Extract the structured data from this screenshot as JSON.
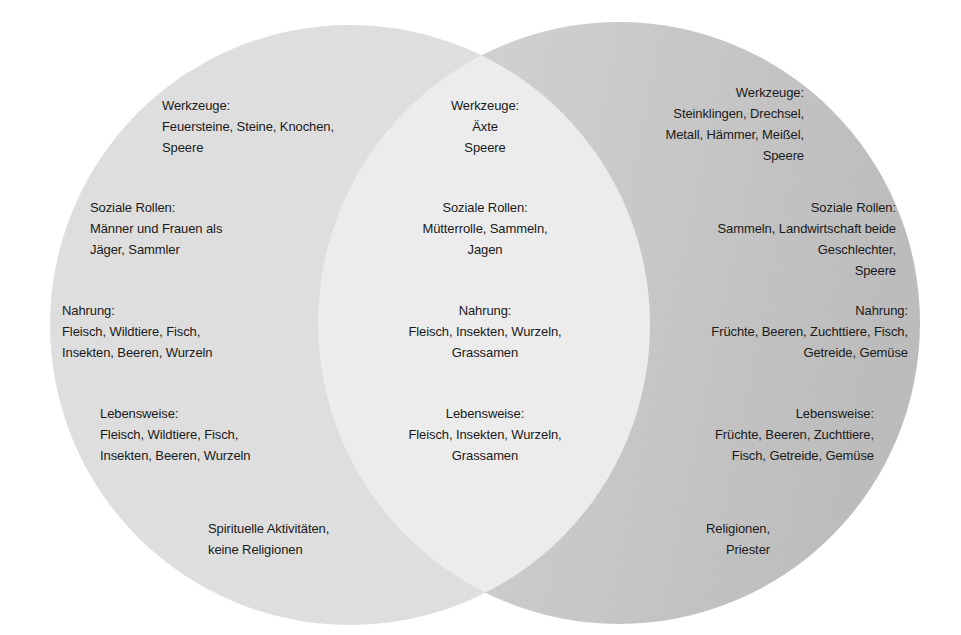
{
  "diagram": {
    "type": "venn",
    "colors": {
      "background": "#ffffff",
      "left_circle": "#dedede",
      "right_circle_light": "#d6d6d6",
      "right_circle_dark": "#bdbdbd",
      "overlap": "#ececec",
      "text": "#1a1a1a"
    },
    "left": {
      "werkzeuge": {
        "title": "Werkzeuge:",
        "lines": [
          "Feuersteine, Steine, Knochen,",
          "Speere"
        ]
      },
      "soziale_rollen": {
        "title": "Soziale Rollen:",
        "lines": [
          "Männer und Frauen als",
          "Jäger, Sammler"
        ]
      },
      "nahrung": {
        "title": "Nahrung:",
        "lines": [
          "Fleisch, Wildtiere, Fisch,",
          "Insekten, Beeren, Wurzeln"
        ]
      },
      "lebensweise": {
        "title": "Lebensweise:",
        "lines": [
          "Fleisch, Wildtiere, Fisch,",
          "Insekten, Beeren, Wurzeln"
        ]
      },
      "religion": {
        "lines": [
          "Spirituelle Aktivitäten,",
          "keine Religionen"
        ]
      }
    },
    "overlap": {
      "werkzeuge": {
        "title": "Werkzeuge:",
        "lines": [
          "Äxte",
          "Speere"
        ]
      },
      "soziale_rollen": {
        "title": "Soziale Rollen:",
        "lines": [
          "Mütterrolle, Sammeln,",
          "Jagen"
        ]
      },
      "nahrung": {
        "title": "Nahrung:",
        "lines": [
          "Fleisch, Insekten, Wurzeln,",
          "Grassamen"
        ]
      },
      "lebensweise": {
        "title": "Lebensweise:",
        "lines": [
          "Fleisch, Insekten, Wurzeln,",
          "Grassamen"
        ]
      }
    },
    "right": {
      "werkzeuge": {
        "title": "Werkzeuge:",
        "lines": [
          "Steinklingen, Drechsel,",
          "Metall, Hämmer, Meißel,",
          "Speere"
        ]
      },
      "soziale_rollen": {
        "title": "Soziale Rollen:",
        "lines": [
          "Sammeln, Landwirtschaft beide",
          "Geschlechter,",
          "Speere"
        ]
      },
      "nahrung": {
        "title": "Nahrung:",
        "lines": [
          "Früchte, Beeren,  Zuchttiere, Fisch,",
          "Getreide, Gemüse"
        ]
      },
      "lebensweise": {
        "title": "Lebensweise:",
        "lines": [
          "Früchte, Beeren,  Zuchttiere,",
          "Fisch, Getreide, Gemüse"
        ]
      },
      "religion": {
        "lines": [
          "Religionen,",
          "Priester"
        ]
      }
    }
  }
}
